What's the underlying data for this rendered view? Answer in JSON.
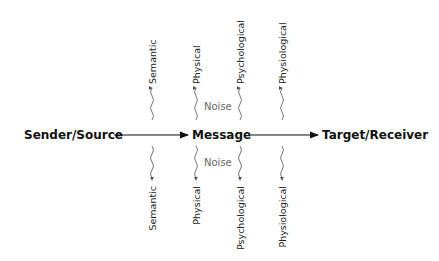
{
  "diagram": {
    "type": "communication-model",
    "nodes": {
      "sender": "Sender/Source",
      "message": "Message",
      "receiver": "Target/Receiver"
    },
    "noise_label": "Noise",
    "top_noise": [
      "Semantic",
      "Physical",
      "Psychological",
      "Physiological"
    ],
    "bottom_noise": [
      "Semantic",
      "Physical",
      "Psychological",
      "Physiological"
    ],
    "colors": {
      "text": "#111111",
      "lines": "#555555",
      "noise_text": "#666666"
    }
  }
}
